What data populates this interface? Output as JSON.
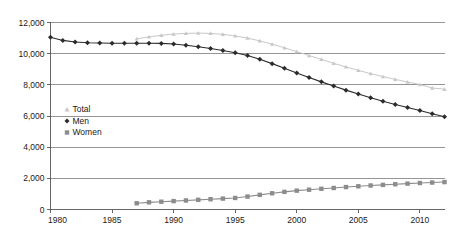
{
  "chart_data": {
    "type": "line",
    "title": "",
    "subtitle": "",
    "xlabel": "",
    "ylabel": "",
    "xlim": [
      1980,
      2012
    ],
    "ylim": [
      0,
      12000
    ],
    "yticks": [
      0,
      2000,
      4000,
      6000,
      8000,
      10000,
      12000
    ],
    "ytick_labels": [
      "0",
      "2,000",
      "4,000",
      "6,000",
      "8,000",
      "10,000",
      "12,000"
    ],
    "xticks": [
      1980,
      1985,
      1990,
      1995,
      2000,
      2005,
      2010
    ],
    "xtick_labels": [
      "1980",
      "1985",
      "1990",
      "1995",
      "2000",
      "2005",
      "2010"
    ],
    "grid": true,
    "grid_axis": "y",
    "legend_position": "inside-left",
    "series": [
      {
        "name": "Total",
        "marker": "triangle",
        "color": "#c8c8c8",
        "x": [
          1987,
          1988,
          1989,
          1990,
          1991,
          1992,
          1993,
          1994,
          1995,
          1996,
          1997,
          1998,
          1999,
          2000,
          2001,
          2002,
          2003,
          2004,
          2005,
          2006,
          2007,
          2008,
          2009,
          2010,
          2011,
          2012
        ],
        "values": [
          10950,
          11080,
          11180,
          11260,
          11300,
          11320,
          11300,
          11240,
          11140,
          11000,
          10820,
          10610,
          10380,
          10130,
          9880,
          9630,
          9380,
          9150,
          8930,
          8720,
          8530,
          8350,
          8180,
          8020,
          7800,
          7720
        ]
      },
      {
        "name": "Men",
        "marker": "diamond",
        "color": "#2b2b2b",
        "x": [
          1980,
          1981,
          1982,
          1983,
          1984,
          1985,
          1986,
          1987,
          1988,
          1989,
          1990,
          1991,
          1992,
          1993,
          1994,
          1995,
          1996,
          1997,
          1998,
          1999,
          2000,
          2001,
          2002,
          2003,
          2004,
          2005,
          2006,
          2007,
          2008,
          2009,
          2010,
          2011,
          2012
        ],
        "values": [
          11050,
          10850,
          10750,
          10700,
          10680,
          10670,
          10670,
          10670,
          10670,
          10660,
          10620,
          10540,
          10440,
          10330,
          10200,
          10060,
          9880,
          9640,
          9360,
          9060,
          8760,
          8470,
          8190,
          7920,
          7660,
          7410,
          7170,
          6950,
          6740,
          6540,
          6350,
          6150,
          5950
        ]
      },
      {
        "name": "Women",
        "marker": "square",
        "color": "#8c8c8c",
        "x": [
          1987,
          1988,
          1989,
          1990,
          1991,
          1992,
          1993,
          1994,
          1995,
          1996,
          1997,
          1998,
          1999,
          2000,
          2001,
          2002,
          2003,
          2004,
          2005,
          2006,
          2007,
          2008,
          2009,
          2010,
          2011,
          2012
        ],
        "values": [
          400,
          460,
          500,
          540,
          580,
          620,
          660,
          700,
          740,
          830,
          940,
          1040,
          1130,
          1210,
          1270,
          1330,
          1380,
          1440,
          1490,
          1540,
          1580,
          1620,
          1660,
          1700,
          1730,
          1760
        ]
      }
    ],
    "legend": [
      {
        "label": "Total",
        "marker": "triangle",
        "color": "#c8c8c8"
      },
      {
        "label": "Men",
        "marker": "diamond",
        "color": "#2b2b2b"
      },
      {
        "label": "Women",
        "marker": "square",
        "color": "#8c8c8c"
      }
    ]
  }
}
